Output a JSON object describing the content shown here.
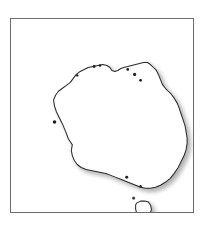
{
  "figure": {
    "title": "Australia outline map",
    "caption": "",
    "width": 207,
    "height": 229,
    "background_color": "#ffffff"
  },
  "frame": {
    "name": "map-border",
    "x": 10,
    "y": 18,
    "width": 184,
    "height": 195,
    "border_color": "#6b6b6b",
    "border_width": 1,
    "fill_color": "#ffffff"
  },
  "style": {
    "coastline_color": "#2b2b2b",
    "coastline_width": 1,
    "landmass_fill": "#ffffff",
    "shadow_color": "#b0b0b0",
    "shadow_offset_x": 3,
    "shadow_offset_y": 3,
    "shadow_blur": 2.2
  },
  "landmasses": [
    {
      "name": "australia-mainland",
      "label": "Australia mainland",
      "path": "M 62 127 L 58 121 L 55 113 L 52 106 L 49 100 L 46 94 L 44 88 L 43 82 L 45 77 L 48 73 L 52 70 L 56 67 L 60 64 L 63 60 L 66 56 L 70 53 L 74 51 L 78 49 L 83 48 L 88 47 L 93 46 L 97 47 L 100 49 L 102 52 L 105 53 L 108 52 L 111 50 L 114 49 L 118 48 L 122 47 L 126 46 L 130 45 L 134 44 L 138 44 L 141 46 L 144 49 L 147 52 L 149 56 L 151 61 L 153 66 L 156 70 L 159 73 L 162 76 L 165 80 L 168 85 L 170 90 L 172 96 L 174 102 L 176 108 L 177 114 L 178 120 L 178 126 L 177 132 L 175 138 L 172 144 L 169 150 L 165 156 L 161 161 L 156 165 L 151 168 L 146 170 L 141 171 L 136 171 L 131 170 L 126 168 L 121 166 L 116 164 L 111 162 L 106 160 L 101 158 L 96 156 L 91 155 L 86 154 L 81 153 L 76 152 L 71 150 L 67 147 L 64 143 L 62 138 L 61 133 Z"
    },
    {
      "name": "tasmania",
      "label": "Tasmania",
      "path": "M 127 186 L 131 184 L 135 184 L 139 185 L 141 188 L 142 192 L 141 196 L 139 199 L 136 201 L 132 201 L 129 199 L 127 196 L 126 192 L 126 188 Z"
    },
    {
      "name": "offshore-islet-north",
      "label": "Small offshore islet",
      "path": "M 123 180 L 125 180 L 125 182 L 123 182 Z"
    }
  ],
  "coastline_points": {
    "mainland": [
      [
        62,
        127
      ],
      [
        58,
        121
      ],
      [
        55,
        113
      ],
      [
        52,
        106
      ],
      [
        49,
        100
      ],
      [
        46,
        94
      ],
      [
        44,
        88
      ],
      [
        45,
        80
      ],
      [
        49,
        73
      ],
      [
        55,
        68
      ],
      [
        61,
        63
      ],
      [
        67,
        57
      ],
      [
        74,
        51
      ],
      [
        82,
        48
      ],
      [
        90,
        46
      ],
      [
        97,
        47
      ],
      [
        102,
        52
      ],
      [
        108,
        52
      ],
      [
        114,
        49
      ],
      [
        122,
        47
      ],
      [
        130,
        45
      ],
      [
        138,
        44
      ],
      [
        144,
        49
      ],
      [
        149,
        57
      ],
      [
        153,
        66
      ],
      [
        159,
        73
      ],
      [
        165,
        80
      ],
      [
        170,
        90
      ],
      [
        174,
        102
      ],
      [
        177,
        114
      ],
      [
        178,
        124
      ],
      [
        176,
        136
      ],
      [
        171,
        147
      ],
      [
        164,
        157
      ],
      [
        155,
        165
      ],
      [
        146,
        170
      ],
      [
        136,
        171
      ],
      [
        126,
        168
      ],
      [
        116,
        164
      ],
      [
        106,
        160
      ],
      [
        96,
        156
      ],
      [
        86,
        154
      ],
      [
        76,
        152
      ],
      [
        68,
        148
      ],
      [
        63,
        141
      ],
      [
        61,
        133
      ]
    ],
    "tasmania": [
      [
        127,
        186
      ],
      [
        133,
        184
      ],
      [
        139,
        185
      ],
      [
        142,
        190
      ],
      [
        141,
        196
      ],
      [
        137,
        201
      ],
      [
        131,
        201
      ],
      [
        127,
        196
      ],
      [
        126,
        190
      ]
    ]
  },
  "regions_depicted": [
    {
      "name": "cape-york-peninsula",
      "label": "Cape York Peninsula"
    },
    {
      "name": "gulf-of-carpentaria",
      "label": "Gulf of Carpentaria"
    },
    {
      "name": "arnhem-land",
      "label": "Arnhem Land"
    },
    {
      "name": "great-australian-bight",
      "label": "Great Australian Bight"
    },
    {
      "name": "shark-bay",
      "label": "Shark Bay"
    },
    {
      "name": "bass-strait",
      "label": "Bass Strait"
    }
  ]
}
